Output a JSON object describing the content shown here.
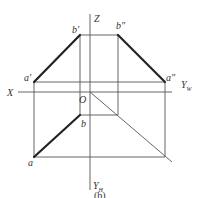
{
  "diagram": {
    "type": "orthographic-projection",
    "caption": "(b)",
    "axes": {
      "x_label": "X",
      "z_label": "Z",
      "origin_label": "O",
      "yw_label": "Y",
      "yw_sub": "W",
      "yh_label": "Y",
      "yh_sub": "H"
    },
    "points": {
      "a_prime": "a'",
      "b_prime": "b'",
      "a_dprime": "a\"",
      "b_dprime": "b\"",
      "a": "a",
      "b": "b"
    },
    "colors": {
      "thin_line": "#555555",
      "thick_line": "#222222",
      "text": "#333333"
    }
  }
}
